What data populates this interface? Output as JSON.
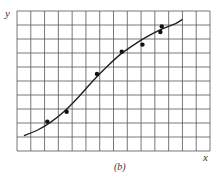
{
  "chart_data": {
    "type": "scatter",
    "title": "",
    "caption": "(b)",
    "xlabel": "x",
    "ylabel": "y",
    "xlim": [
      0,
      14
    ],
    "ylim": [
      0,
      10
    ],
    "grid": true,
    "grid_cells": {
      "x": 14,
      "y": 10
    },
    "legend": null,
    "series": [
      {
        "name": "data points",
        "kind": "scatter",
        "x": [
          2.2,
          3.6,
          5.8,
          7.6,
          9.1,
          10.4,
          10.5
        ],
        "y": [
          2.1,
          2.8,
          5.5,
          7.1,
          7.6,
          8.5,
          8.9
        ]
      },
      {
        "name": "fitted curve",
        "kind": "line",
        "x": [
          0.5,
          1.5,
          2.5,
          3.5,
          4.5,
          5.5,
          6.5,
          7.5,
          8.5,
          9.5,
          10.5,
          11.5,
          12.0
        ],
        "y": [
          1.1,
          1.5,
          2.1,
          2.9,
          3.9,
          5.0,
          6.0,
          6.9,
          7.6,
          8.2,
          8.7,
          9.1,
          9.4
        ]
      }
    ]
  },
  "labels": {
    "x_axis": "x",
    "y_axis": "y",
    "caption": "(b)"
  },
  "colors": {
    "grid": "#555555",
    "curve": "#222222",
    "points": "#111111"
  }
}
